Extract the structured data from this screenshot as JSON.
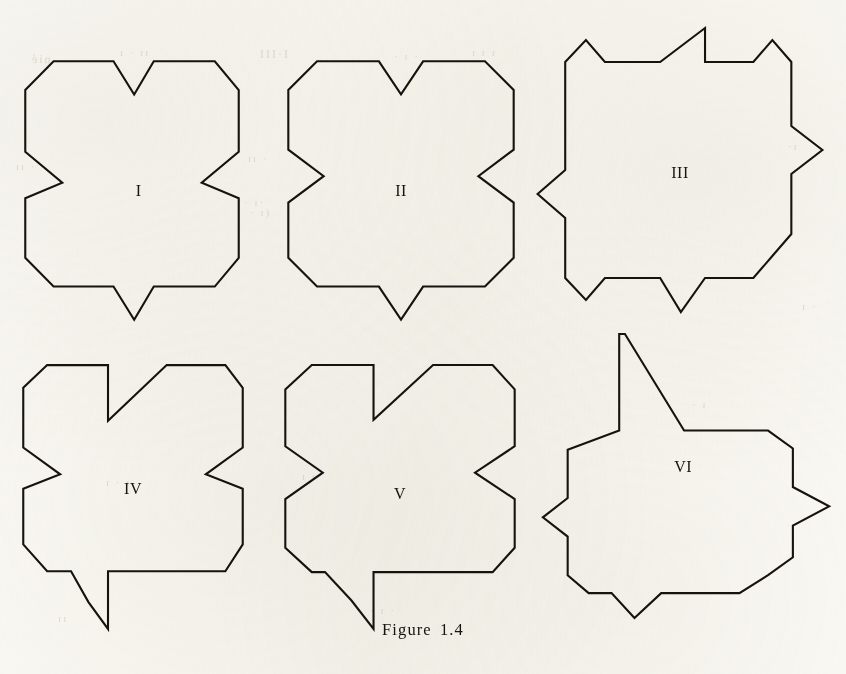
{
  "figure": {
    "caption": "Figure 1.4",
    "stroke_color": "#16130f",
    "page_color": "#fbfaf6",
    "label_color": "#18150f",
    "viewbox": "0 0 240 260"
  },
  "ghost_text": [
    {
      "text": "nié",
      "x": 30,
      "y": 52,
      "size": 12,
      "rotate": -1
    },
    {
      "text": "ıı · ı",
      "x": 118,
      "y": 46,
      "size": 11,
      "rotate": 0
    },
    {
      "text": "I·III",
      "x": 258,
      "y": 47,
      "size": 12,
      "rotate": 0
    },
    {
      "text": "· ı ·",
      "x": 392,
      "y": 50,
      "size": 11,
      "rotate": 0
    },
    {
      "text": "ı ı ı",
      "x": 470,
      "y": 46,
      "size": 11,
      "rotate": 0
    },
    {
      "text": "· ıı",
      "x": 246,
      "y": 152,
      "size": 11,
      "rotate": 0
    },
    {
      "text": "ı·",
      "x": 786,
      "y": 140,
      "size": 11,
      "rotate": 0
    },
    {
      "text": "·ı ·",
      "x": 242,
      "y": 196,
      "size": 11,
      "rotate": 0
    },
    {
      "text": "(ı ·",
      "x": 248,
      "y": 206,
      "size": 11,
      "rotate": 0
    },
    {
      "text": "· ıı",
      "x": 14,
      "y": 160,
      "size": 11,
      "rotate": 0
    },
    {
      "text": "ı · ı",
      "x": 104,
      "y": 476,
      "size": 11,
      "rotate": 0
    },
    {
      "text": "·ı ı",
      "x": 300,
      "y": 470,
      "size": 11,
      "rotate": 0
    },
    {
      "text": "ı ·",
      "x": 690,
      "y": 398,
      "size": 11,
      "rotate": 0
    },
    {
      "text": "· ı",
      "x": 800,
      "y": 300,
      "size": 11,
      "rotate": 0
    },
    {
      "text": "ıı",
      "x": 56,
      "y": 612,
      "size": 11,
      "rotate": 0
    },
    {
      "text": "· ı ·",
      "x": 368,
      "y": 604,
      "size": 11,
      "rotate": 0
    }
  ],
  "shapes": [
    {
      "id": "shape-1",
      "label": "I",
      "name": "polygon-i",
      "left": 22,
      "top": 58,
      "width": 220,
      "height": 265,
      "label_x": 0.53,
      "label_y": 0.5,
      "points": "48,28 103,28 122,58 140,28 196,28 218,54 218,110 184,138 218,152 218,206 196,232 140,232 122,262 103,232 48,232 22,206 22,152 56,138 22,110 22,54",
      "notes": "octagonal outline with V notches top and bottom and sawtooth notches left and right"
    },
    {
      "id": "shape-2",
      "label": "II",
      "name": "polygon-ii",
      "left": 285,
      "top": 58,
      "width": 232,
      "height": 265,
      "label_x": 0.5,
      "label_y": 0.5,
      "points": "50,28 106,28 126,58 146,28 202,28 228,54 228,108 196,132 228,156 228,206 202,232 146,232 126,262 106,232 50,232 24,206 24,156 56,132 24,108 24,54",
      "notes": "fully symmetric: V notches on all four sides"
    },
    {
      "id": "shape-3",
      "label": "III",
      "name": "polygon-iii",
      "left": 535,
      "top": 25,
      "width": 290,
      "height": 290,
      "label_x": 0.5,
      "label_y": 0.51,
      "points": "34,40 58,18 80,40 144,40 196,6 196,40 252,40 274,18 296,40 296,104 332,128 296,152 296,212 274,234 252,256 196,256 168,290 144,256 80,256 58,278 34,256 34,196 2,172 34,148 34,104",
      "notes": "star-like outline with outward spikes; top spike is a tall diagonal rise with vertical drop"
    },
    {
      "id": "shape-4",
      "label": "IV",
      "name": "polygon-iv",
      "left": 20,
      "top": 362,
      "width": 226,
      "height": 270,
      "label_x": 0.5,
      "label_y": 0.47,
      "points": "48,26 104,26 104,80 158,26 212,26 228,48 228,106 194,132 228,146 228,200 212,226 158,226 104,226 104,282 86,256 70,226 48,226 26,200 26,146 60,132 26,106 26,48",
      "notes": "asymmetric notches: vertical drop then diagonal rise at top and bottom"
    },
    {
      "id": "shape-5",
      "label": "V",
      "name": "polygon-v",
      "left": 282,
      "top": 362,
      "width": 236,
      "height": 270,
      "label_x": 0.5,
      "label_y": 0.49,
      "points": "50,26 106,26 106,80 160,26 214,26 234,50 234,106 198,132 234,158 234,206 214,230 160,230 106,230 106,286 86,258 62,230 50,230 26,206 26,158 60,132 26,106 26,50",
      "notes": "like IV but with symmetric side notches"
    },
    {
      "id": "shape-6",
      "label": "VI",
      "name": "polygon-vi",
      "left": 540,
      "top": 332,
      "width": 292,
      "height": 288,
      "label_x": 0.49,
      "label_y": 0.47,
      "points": "80,148 80,8 86,8 148,148 206,148 206,148 236,148 262,174 262,230 300,258 262,286 262,332 236,358 206,384 148,384 124,384 96,420 72,384 48,384 26,358 26,302 0,274 26,246 26,176",
      "notes": "star outline with long vertical-then-diagonal top spike and a long right spike"
    }
  ]
}
